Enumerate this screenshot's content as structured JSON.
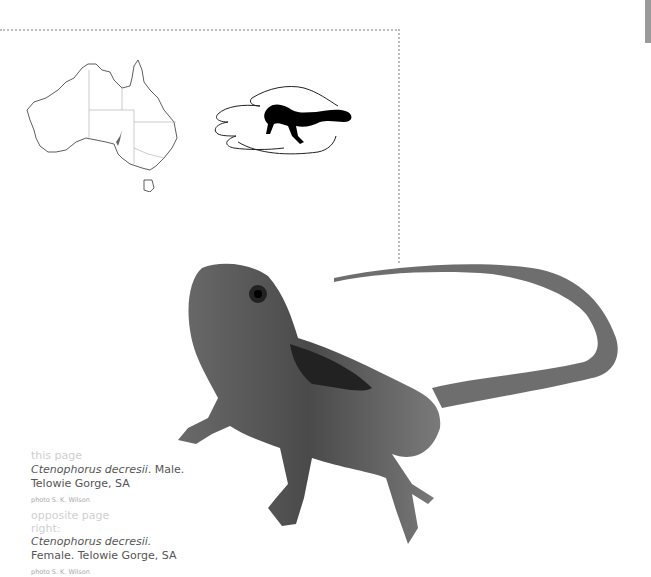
{
  "figures": {
    "map": {
      "alt": "Map of Australia with distribution in South Australia"
    },
    "hand_scale": {
      "alt": "Size of lizard relative to a hand"
    },
    "photo": {
      "alt": "Photograph of Ctenophorus decresii male"
    }
  },
  "captions": {
    "this_page": {
      "label": "this page",
      "species": "Ctenophorus decresii",
      "desc1": ". Male.",
      "desc2": "Telowie Gorge, SA",
      "credit": "photo S. K. Wilson"
    },
    "opposite_page": {
      "label": "opposite page",
      "position": "right:",
      "species": "Ctenophorus decresii.",
      "desc": "Female. Telowie Gorge, SA",
      "credit": "photo S. K. Wilson"
    }
  },
  "colors": {
    "dotted_border": "#bdbdbd",
    "caption_label": "#cfcfcf",
    "caption_text": "#555555",
    "edge_tab": "#9a9a9a"
  }
}
